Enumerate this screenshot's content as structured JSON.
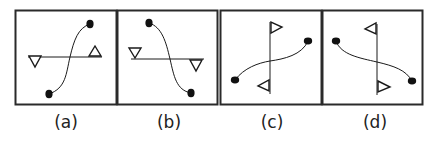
{
  "figure": {
    "panels": [
      {
        "label": "(a)",
        "line_orientation": "horizontal",
        "triangles": [
          "left: pointing down, below line",
          "right: pointing up, above line"
        ],
        "curve": "S-curve from bottom-left dot to top-right dot"
      },
      {
        "label": "(b)",
        "line_orientation": "horizontal",
        "triangles": [
          "left: pointing down, above line",
          "right: pointing down, below line"
        ],
        "curve": "reverse S-curve from top-left dot to bottom-right dot"
      },
      {
        "label": "(c)",
        "line_orientation": "vertical",
        "triangles": [
          "top: pointing right, right of line",
          "bottom: pointing left, left of line"
        ],
        "curve": "S-curve from lower-left dot to upper-right dot"
      },
      {
        "label": "(d)",
        "line_orientation": "vertical",
        "triangles": [
          "top: pointing left, left of line",
          "bottom: pointing right, right of line"
        ],
        "curve": "S-curve from upper-left dot to lower-right dot"
      }
    ],
    "colors": {
      "stroke": "#1a1a1a",
      "frame": "#2a2a2a",
      "background": "#ffffff"
    }
  }
}
